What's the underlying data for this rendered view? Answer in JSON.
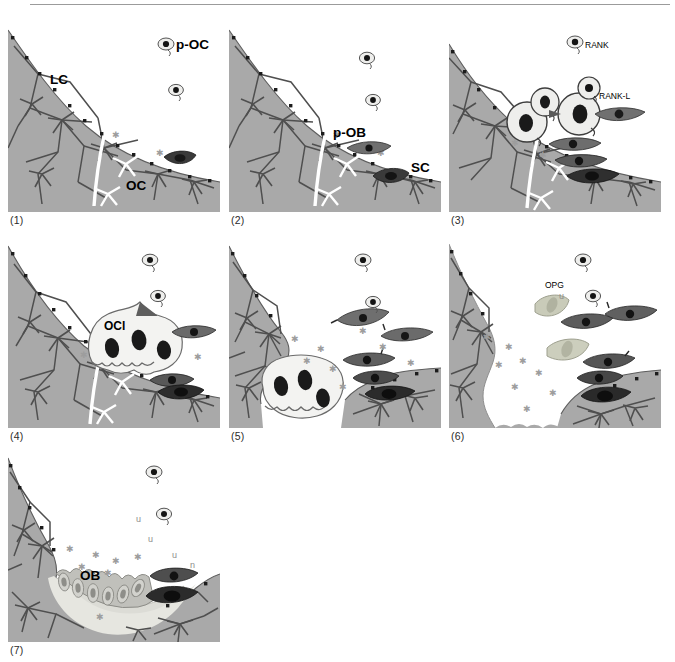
{
  "figure": {
    "panel_count": 7,
    "colors": {
      "bone_matrix": "#a9a9a9",
      "bone_matrix_dark": "#9a9a9a",
      "canaliculi": "#4a4a4a",
      "osteocyte_lacuna": "#1c1c1c",
      "cement_line": "#ffffff",
      "osteoclast_cytoplasm": "#f2f2f0",
      "osteoclast_nucleus": "#111111",
      "precursor_fill": "#eeeeec",
      "spindle_mid": "#7d7d7d",
      "spindle_dark": "#3c3c3c",
      "opg_cell": "#c9cbb9",
      "osteoid": "#dcdcd6",
      "osteoblast": "#c6c6c2",
      "marrow": "#ffffff",
      "star_mark": "#9d9d9d",
      "label_text": "#000000",
      "caption_text": "#2b2b2b",
      "rule": "#9b9b9b"
    },
    "panels": [
      {
        "id": 1,
        "caption": "(1)",
        "labels": [
          {
            "text": "p-OC",
            "kind": "bold-large",
            "meaning": "osteoclast precursor"
          },
          {
            "text": "LC",
            "kind": "bold-large",
            "meaning": "lacunar-canalicular network / lining cells"
          },
          {
            "text": "OC",
            "kind": "bold-large",
            "meaning": "osteocyte"
          }
        ],
        "features": [
          "quiescent bone surface",
          "cement line",
          "osteocyte network",
          "two circulating precursors"
        ]
      },
      {
        "id": 2,
        "caption": "(2)",
        "labels": [
          {
            "text": "p-OB",
            "kind": "bold-large",
            "meaning": "osteoblast precursor"
          },
          {
            "text": "SC",
            "kind": "bold-large",
            "meaning": "stromal cell"
          }
        ],
        "features": [
          "two circulating precursors",
          "spindle cell on surface",
          "dark stromal cell"
        ]
      },
      {
        "id": 3,
        "caption": "(3)",
        "labels": [
          {
            "text": "RANK",
            "kind": "bold-small",
            "meaning": "receptor activator of NF-kB"
          },
          {
            "text": "RANK-L",
            "kind": "bold-small",
            "meaning": "RANK ligand"
          }
        ],
        "features": [
          "fusing pre-osteoclasts",
          "RANK-RANKL signalling",
          "three stromal cells"
        ]
      },
      {
        "id": 4,
        "caption": "(4)",
        "labels": [
          {
            "text": "OCl",
            "kind": "bold-large",
            "meaning": "multinucleated osteoclast"
          }
        ],
        "features": [
          "osteoclast attached to bone",
          "ruffled border",
          "three nuclei",
          "resorption begins"
        ]
      },
      {
        "id": 5,
        "caption": "(5)",
        "labels": [],
        "features": [
          "resorption lacuna excavated",
          "osteoclast in pit",
          "migrating osteoblast precursors"
        ]
      },
      {
        "id": 6,
        "caption": "(6)",
        "labels": [
          {
            "text": "OPG",
            "kind": "bold-small",
            "meaning": "osteoprotegerin"
          },
          {
            "text": "u",
            "kind": "mark",
            "meaning": "secreted factor"
          }
        ],
        "features": [
          "resorption complete",
          "OPG-secreting cells",
          "reversal phase"
        ]
      },
      {
        "id": 7,
        "caption": "(7)",
        "labels": [
          {
            "text": "OB",
            "kind": "bold-large",
            "meaning": "osteoblast"
          },
          {
            "text": "u",
            "kind": "mark",
            "meaning": "secreted factor"
          },
          {
            "text": "n",
            "kind": "mark",
            "meaning": "secreted factor"
          }
        ],
        "features": [
          "osteoblast layer lining lacuna",
          "new osteoid matrix",
          "bone formation phase"
        ]
      }
    ]
  }
}
